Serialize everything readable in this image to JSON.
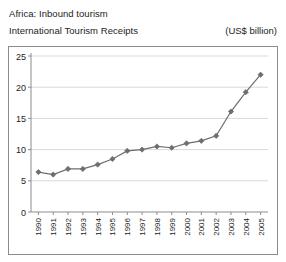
{
  "header": {
    "line1": "Africa: Inbound tourism",
    "line2": "International Tourism Receipts",
    "units": "(US$ billion)"
  },
  "chart_data": {
    "type": "line",
    "title": "International Tourism Receipts",
    "subtitle": "Africa: Inbound tourism",
    "xlabel": "",
    "ylabel": "",
    "units": "(US$ billion)",
    "categories": [
      "1990",
      "1991",
      "1992",
      "1993",
      "1994",
      "1995",
      "1996",
      "1997",
      "1998",
      "1999",
      "2000",
      "2001",
      "2002",
      "2003",
      "2004",
      "2005"
    ],
    "values": [
      6.4,
      6.0,
      6.9,
      6.9,
      7.6,
      8.5,
      9.8,
      10.0,
      10.5,
      10.3,
      11.0,
      11.4,
      12.2,
      16.1,
      19.2,
      22.0
    ],
    "ylim": [
      0,
      25
    ],
    "yticks": [
      0,
      5,
      10,
      15,
      20,
      25
    ],
    "ytick_labels": [
      "0",
      "5",
      "10",
      "15",
      "20",
      "25"
    ],
    "grid": true,
    "legend": false,
    "series_color": "#6e6e6e",
    "marker": "diamond",
    "axis_color": "#8c8c8c",
    "grid_color": "#d9d9d9"
  }
}
